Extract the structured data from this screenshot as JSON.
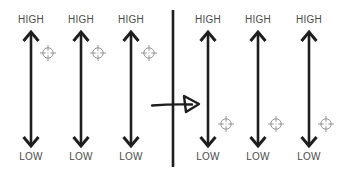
{
  "diagram": {
    "type": "before-after-shift",
    "before": {
      "scales": [
        {
          "top_label": "HIGH",
          "bottom_label": "LOW",
          "x": 31,
          "marker": {
            "x": 48,
            "y": 53,
            "icon": "crosshair-icon"
          }
        },
        {
          "top_label": "HIGH",
          "bottom_label": "LOW",
          "x": 81,
          "marker": {
            "x": 98,
            "y": 53,
            "icon": "crosshair-icon"
          }
        },
        {
          "top_label": "HIGH",
          "bottom_label": "LOW",
          "x": 131,
          "marker": {
            "x": 149,
            "y": 53,
            "icon": "crosshair-icon"
          }
        }
      ]
    },
    "after": {
      "scales": [
        {
          "top_label": "HIGH",
          "bottom_label": "LOW",
          "x": 208,
          "marker": {
            "x": 226,
            "y": 124,
            "icon": "crosshair-icon"
          }
        },
        {
          "top_label": "HIGH",
          "bottom_label": "LOW",
          "x": 258,
          "marker": {
            "x": 276,
            "y": 124,
            "icon": "crosshair-icon"
          }
        },
        {
          "top_label": "HIGH",
          "bottom_label": "LOW",
          "x": 309,
          "marker": {
            "x": 326,
            "y": 124,
            "icon": "crosshair-icon"
          }
        }
      ]
    },
    "divider": {
      "icon": "vertical-divider"
    },
    "transition": {
      "icon": "arrow-right-icon"
    },
    "colors": {
      "stroke": "#1e1e1e",
      "label": "#4a4a4a",
      "marker": "#8a8a8a",
      "background": "#ffffff"
    }
  }
}
